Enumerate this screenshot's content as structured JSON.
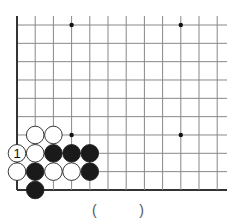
{
  "board": {
    "origin_x": 17,
    "origin_y": 25,
    "spacing_x": 18.2,
    "spacing_y": 18.33,
    "cols": 12,
    "rows": 10,
    "right_extent": 227,
    "edges": [
      "left",
      "bottom"
    ],
    "line_color": "#888888",
    "edge_color": "#333333",
    "star_points": [
      [
        3,
        0
      ],
      [
        9,
        0
      ],
      [
        3,
        6
      ],
      [
        9,
        6
      ]
    ],
    "stones": [
      {
        "col": 1,
        "row": 6,
        "color": "white"
      },
      {
        "col": 2,
        "row": 6,
        "color": "white"
      },
      {
        "col": 0,
        "row": 7,
        "color": "white",
        "label": "1"
      },
      {
        "col": 1,
        "row": 7,
        "color": "white"
      },
      {
        "col": 2,
        "row": 7,
        "color": "black"
      },
      {
        "col": 3,
        "row": 7,
        "color": "black"
      },
      {
        "col": 4,
        "row": 7,
        "color": "black"
      },
      {
        "col": 0,
        "row": 8,
        "color": "white"
      },
      {
        "col": 1,
        "row": 8,
        "color": "black"
      },
      {
        "col": 2,
        "row": 8,
        "color": "white"
      },
      {
        "col": 3,
        "row": 8,
        "color": "white"
      },
      {
        "col": 4,
        "row": 8,
        "color": "black"
      },
      {
        "col": 1,
        "row": 9,
        "color": "black"
      }
    ]
  },
  "answer": {
    "open_paren": "(",
    "close_paren": ")"
  }
}
